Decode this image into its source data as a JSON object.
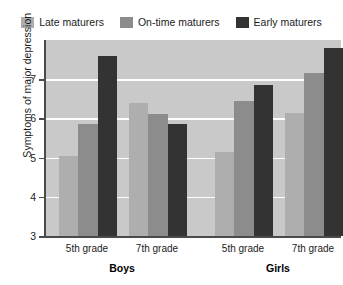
{
  "chart_data": {
    "type": "bar",
    "title": "",
    "xlabel": "",
    "ylabel": "Symptoms of major depression",
    "ylim": [
      3,
      8
    ],
    "yticks": [
      3,
      4,
      5,
      6,
      7
    ],
    "ytick_labels": [
      "3",
      "4",
      "5",
      "6",
      "7"
    ],
    "grid": true,
    "grid_axis": "y",
    "legend_position": "top",
    "categories": [
      "5th grade",
      "7th grade",
      "5th grade",
      "7th grade"
    ],
    "supercategories": [
      "Boys",
      "Girls"
    ],
    "series": [
      {
        "name": "Late maturers",
        "color": "#aeaeae",
        "values": [
          5.05,
          6.4,
          5.15,
          6.15
        ]
      },
      {
        "name": "On-time maturers",
        "color": "#8c8c8c",
        "values": [
          5.85,
          6.1,
          6.45,
          7.15
        ]
      },
      {
        "name": "Early maturers",
        "color": "#333333",
        "values": [
          7.6,
          5.85,
          6.85,
          7.8
        ]
      }
    ],
    "groups": [
      {
        "supercategory": "Boys",
        "category": "5th grade",
        "bars": [
          {
            "series": "Late maturers",
            "value": 5.05
          },
          {
            "series": "On-time maturers",
            "value": 5.85
          },
          {
            "series": "Early maturers",
            "value": 7.6
          }
        ]
      },
      {
        "supercategory": "Boys",
        "category": "7th grade",
        "bars": [
          {
            "series": "Late maturers",
            "value": 6.4
          },
          {
            "series": "On-time maturers",
            "value": 6.1
          },
          {
            "series": "Early maturers",
            "value": 5.85
          }
        ]
      },
      {
        "supercategory": "Girls",
        "category": "5th grade",
        "bars": [
          {
            "series": "Late maturers",
            "value": 5.15
          },
          {
            "series": "On-time maturers",
            "value": 6.45
          },
          {
            "series": "Early maturers",
            "value": 6.85
          }
        ]
      },
      {
        "supercategory": "Girls",
        "category": "7th grade",
        "bars": [
          {
            "series": "Late maturers",
            "value": 6.15
          },
          {
            "series": "On-time maturers",
            "value": 7.15
          },
          {
            "series": "Early maturers",
            "value": 7.8
          }
        ]
      }
    ]
  },
  "legend": {
    "items": [
      {
        "label": "Late maturers",
        "color": "#aeaeae"
      },
      {
        "label": "On-time maturers",
        "color": "#8c8c8c"
      },
      {
        "label": "Early maturers",
        "color": "#333333"
      }
    ]
  },
  "axis": {
    "y_title": "Symptoms of major depression",
    "y_tick_labels": [
      "7",
      "6",
      "5",
      "4",
      "3"
    ],
    "x_tick_labels": [
      "5th grade",
      "7th grade",
      "5th grade",
      "7th grade"
    ],
    "x_super_labels": [
      "Boys",
      "Girls"
    ]
  },
  "colors": {
    "plot_background": "#c9c9c9",
    "gridline": "#fdfdfd",
    "axis": "#4a4a4a",
    "text": "#1c1c1c",
    "page_background": "#ffffff"
  }
}
